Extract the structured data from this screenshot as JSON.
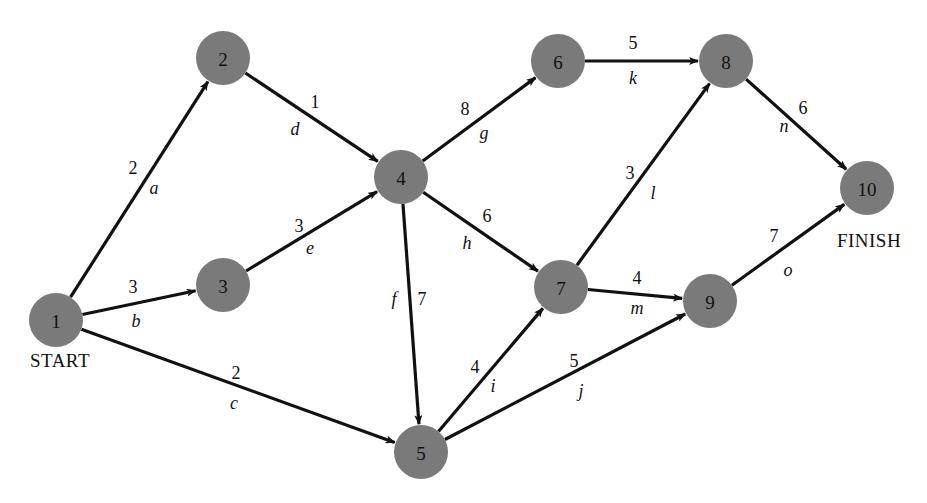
{
  "diagram": {
    "type": "activity-on-arc project network",
    "colors": {
      "node_fill": "#7a7a7a",
      "edge": "#111111",
      "text": "#111111",
      "background": "#ffffff"
    },
    "node_radius": 27,
    "nodes": [
      {
        "id": "1",
        "label": "1",
        "x": 56,
        "y": 320
      },
      {
        "id": "2",
        "label": "2",
        "x": 223,
        "y": 58
      },
      {
        "id": "3",
        "label": "3",
        "x": 223,
        "y": 285
      },
      {
        "id": "4",
        "label": "4",
        "x": 401,
        "y": 177
      },
      {
        "id": "5",
        "label": "5",
        "x": 421,
        "y": 452
      },
      {
        "id": "6",
        "label": "6",
        "x": 558,
        "y": 61
      },
      {
        "id": "7",
        "label": "7",
        "x": 561,
        "y": 287
      },
      {
        "id": "8",
        "label": "8",
        "x": 726,
        "y": 61
      },
      {
        "id": "9",
        "label": "9",
        "x": 710,
        "y": 301
      },
      {
        "id": "10",
        "label": "10",
        "x": 867,
        "y": 188
      }
    ],
    "edges": [
      {
        "from": "1",
        "to": "2",
        "activity": "a",
        "duration": "2",
        "dur_pos": [
          133,
          168
        ],
        "act_pos": [
          154,
          188
        ]
      },
      {
        "from": "1",
        "to": "3",
        "activity": "b",
        "duration": "3",
        "dur_pos": [
          133,
          287
        ],
        "act_pos": [
          136,
          321
        ]
      },
      {
        "from": "1",
        "to": "5",
        "activity": "c",
        "duration": "2",
        "dur_pos": [
          236,
          373
        ],
        "act_pos": [
          234,
          403
        ]
      },
      {
        "from": "2",
        "to": "4",
        "activity": "d",
        "duration": "1",
        "dur_pos": [
          315,
          102
        ],
        "act_pos": [
          295,
          129
        ]
      },
      {
        "from": "3",
        "to": "4",
        "activity": "e",
        "duration": "3",
        "dur_pos": [
          299,
          226
        ],
        "act_pos": [
          310,
          248
        ]
      },
      {
        "from": "4",
        "to": "5",
        "activity": "f",
        "duration": "7",
        "dur_pos": [
          422,
          299
        ],
        "act_pos": [
          394,
          299
        ]
      },
      {
        "from": "4",
        "to": "6",
        "activity": "g",
        "duration": "8",
        "dur_pos": [
          465,
          109
        ],
        "act_pos": [
          484,
          133
        ]
      },
      {
        "from": "4",
        "to": "7",
        "activity": "h",
        "duration": "6",
        "dur_pos": [
          487,
          216
        ],
        "act_pos": [
          467,
          243
        ]
      },
      {
        "from": "5",
        "to": "7",
        "activity": "i",
        "duration": "4",
        "dur_pos": [
          475,
          367
        ],
        "act_pos": [
          493,
          386
        ]
      },
      {
        "from": "5",
        "to": "9",
        "activity": "j",
        "duration": "5",
        "dur_pos": [
          574,
          361
        ],
        "act_pos": [
          581,
          391
        ]
      },
      {
        "from": "6",
        "to": "8",
        "activity": "k",
        "duration": "5",
        "dur_pos": [
          633,
          43
        ],
        "act_pos": [
          633,
          78
        ]
      },
      {
        "from": "7",
        "to": "8",
        "activity": "l",
        "duration": "3",
        "dur_pos": [
          630,
          173
        ],
        "act_pos": [
          653,
          193
        ]
      },
      {
        "from": "7",
        "to": "9",
        "activity": "m",
        "duration": "4",
        "dur_pos": [
          637,
          278
        ],
        "act_pos": [
          637,
          308
        ]
      },
      {
        "from": "8",
        "to": "10",
        "activity": "n",
        "duration": "6",
        "dur_pos": [
          803,
          108
        ],
        "act_pos": [
          784,
          126
        ]
      },
      {
        "from": "9",
        "to": "10",
        "activity": "o",
        "duration": "7",
        "dur_pos": [
          774,
          236
        ],
        "act_pos": [
          788,
          270
        ]
      }
    ],
    "terminal_labels": {
      "start": {
        "text": "START",
        "x": 60,
        "y": 360
      },
      "finish": {
        "text": "FINISH",
        "x": 869,
        "y": 240
      }
    }
  }
}
